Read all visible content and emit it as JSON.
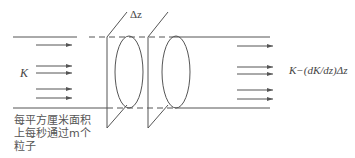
{
  "diagram": {
    "type": "particle-beam-attenuation",
    "labels": {
      "incident_flux": "K",
      "slab_thickness": "Δz",
      "transmitted_flux": "K−(dK/dz)Δz"
    },
    "caption_lines": [
      "每平方厘米面积",
      "上每秒通过m个",
      "粒子"
    ],
    "colors": {
      "line": "#555555",
      "text": "#444444",
      "background": "#ffffff"
    },
    "arrow_count_left": 5,
    "arrow_count_right": 5,
    "planes": 2,
    "ellipses": 2
  }
}
